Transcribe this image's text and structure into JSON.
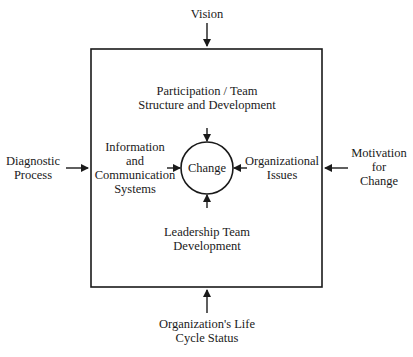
{
  "diagram": {
    "type": "flow-into-center",
    "outer_box": {
      "label": ""
    },
    "center": {
      "label": "Change",
      "shape": "circle"
    },
    "inner_factors": {
      "top": [
        "Participation / Team",
        "Structure and Development"
      ],
      "left": [
        "Information",
        "and",
        "Communication",
        "Systems"
      ],
      "right": [
        "Organizational",
        "Issues"
      ],
      "bottom": [
        "Leadership Team",
        "Development"
      ]
    },
    "external_inputs": {
      "top": [
        "Vision"
      ],
      "left": [
        "Diagnostic",
        "Process"
      ],
      "right": [
        "Motivation",
        "for",
        "Change"
      ],
      "bottom": [
        "Organization's Life",
        "Cycle Status"
      ]
    },
    "colors": {
      "line": "#1a1a1a",
      "background": "#ffffff"
    }
  }
}
